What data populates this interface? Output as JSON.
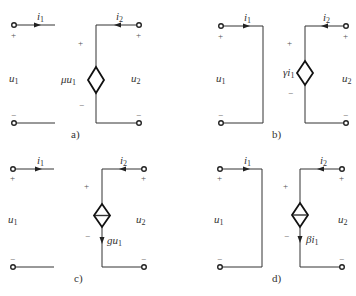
{
  "figure": {
    "panels": [
      {
        "id": "a",
        "caption": "a)",
        "type": "voltage-controlled voltage source",
        "source_label": "μu",
        "source_label_sub": "1",
        "left": {
          "current": "i",
          "current_sub": "1",
          "voltage": "u",
          "voltage_sub": "1",
          "plus": "+",
          "minus": "−"
        },
        "right": {
          "current": "i",
          "current_sub": "2",
          "voltage": "u",
          "voltage_sub": "2",
          "plus": "+",
          "minus": "−"
        },
        "source_plus": "+",
        "source_minus": "−"
      },
      {
        "id": "b",
        "caption": "b)",
        "type": "current-controlled voltage source",
        "source_label": "γi",
        "source_label_sub": "1",
        "left": {
          "current": "i",
          "current_sub": "1",
          "voltage": "u",
          "voltage_sub": "1",
          "plus": "+",
          "minus": "−"
        },
        "right": {
          "current": "i",
          "current_sub": "2",
          "voltage": "u",
          "voltage_sub": "2",
          "plus": "+",
          "minus": "−"
        },
        "source_plus": "+",
        "source_minus": "−"
      },
      {
        "id": "c",
        "caption": "c)",
        "type": "voltage-controlled current source",
        "source_label": "gu",
        "source_label_sub": "1",
        "left": {
          "current": "i",
          "current_sub": "1",
          "voltage": "u",
          "voltage_sub": "1",
          "plus": "+",
          "minus": "−"
        },
        "right": {
          "current": "i",
          "current_sub": "2",
          "voltage": "u",
          "voltage_sub": "2",
          "plus": "+",
          "minus": "−"
        },
        "source_plus": "+",
        "source_minus": "−"
      },
      {
        "id": "d",
        "caption": "d)",
        "type": "current-controlled current source",
        "source_label": "βi",
        "source_label_sub": "1",
        "left": {
          "current": "i",
          "current_sub": "1",
          "voltage": "u",
          "voltage_sub": "1",
          "plus": "+",
          "minus": "−"
        },
        "right": {
          "current": "i",
          "current_sub": "2",
          "voltage": "u",
          "voltage_sub": "2",
          "plus": "+",
          "minus": "−"
        },
        "source_plus": "+",
        "source_minus": "−"
      }
    ]
  }
}
